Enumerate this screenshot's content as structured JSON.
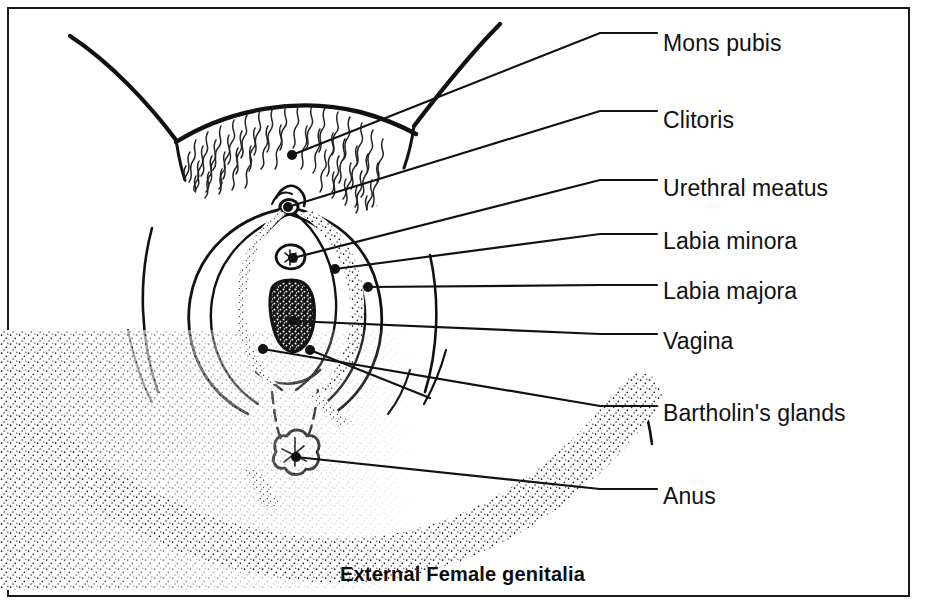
{
  "figure": {
    "caption": "External Female genitalia",
    "title_style": "bold",
    "border_color": "#1a1a1a",
    "ink_color": "#111111",
    "background_color": "#ffffff",
    "width": 925,
    "height": 612
  },
  "labels": [
    {
      "id": "mons-pubis",
      "text": "Mons pubis",
      "x": 663,
      "y": 45,
      "anchor_x": 292,
      "anchor_y": 155,
      "elbow_x": 600,
      "elbow_y": 33
    },
    {
      "id": "clitoris",
      "text": "Clitoris",
      "x": 663,
      "y": 122,
      "anchor_x": 288,
      "anchor_y": 207,
      "elbow_x": 600,
      "elbow_y": 111
    },
    {
      "id": "urethral-meatus",
      "text": "Urethral meatus",
      "x": 663,
      "y": 190,
      "anchor_x": 293,
      "anchor_y": 258,
      "elbow_x": 600,
      "elbow_y": 180
    },
    {
      "id": "labia-minora",
      "text": "Labia minora",
      "x": 663,
      "y": 243,
      "anchor_x": 335,
      "anchor_y": 269,
      "elbow_x": 600,
      "elbow_y": 234
    },
    {
      "id": "labia-majora",
      "text": "Labia majora",
      "x": 663,
      "y": 293,
      "anchor_x": 368,
      "anchor_y": 287,
      "elbow_x": 600,
      "elbow_y": 285
    },
    {
      "id": "vagina",
      "text": "Vagina",
      "x": 663,
      "y": 343,
      "anchor_x": 293,
      "anchor_y": 321,
      "elbow_x": 600,
      "elbow_y": 334
    },
    {
      "id": "bartholins-glands",
      "text": "Bartholin's glands",
      "x": 663,
      "y": 415,
      "anchor_x": 263,
      "anchor_y": 349,
      "elbow_x": 600,
      "elbow_y": 406
    },
    {
      "id": "anus",
      "text": "Anus",
      "x": 663,
      "y": 498,
      "anchor_x": 296,
      "anchor_y": 457,
      "elbow_x": 600,
      "elbow_y": 489
    }
  ],
  "extra_leaders": [
    {
      "id": "bartholins-second",
      "anchor_x": 310,
      "anchor_y": 350,
      "tip_x": 430,
      "tip_y": 398
    }
  ],
  "anatomy_parts": [
    "left-inguinal-fold",
    "right-inguinal-fold",
    "mons-pubis-hairline",
    "pubic-hair",
    "clitoral-hood",
    "labia-majora-left",
    "labia-majora-right",
    "labia-minora-left",
    "labia-minora-right",
    "urethral-meatus-opening",
    "vaginal-opening",
    "perineum",
    "anus-opening",
    "buttock-curve",
    "left-thigh",
    "right-thigh"
  ]
}
